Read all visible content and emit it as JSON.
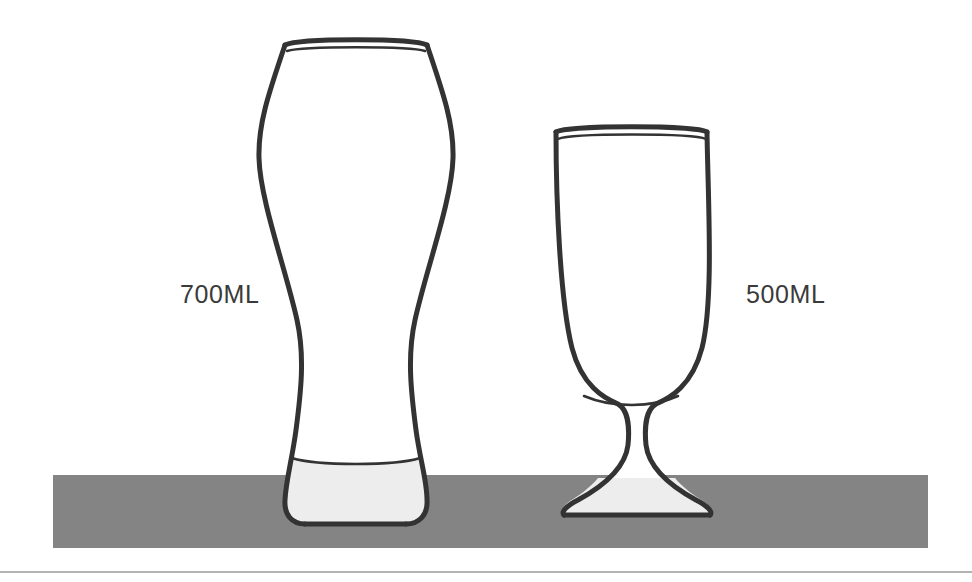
{
  "scene": {
    "title": "Beer glass size comparison",
    "background_color": "#ffffff",
    "stroke_color": "#333333",
    "table_band": {
      "name": "table surface band",
      "color": "#848484",
      "x": 53,
      "y": 475,
      "width": 875,
      "height": 73
    },
    "baseline_rule": {
      "name": "bottom horizontal rule",
      "color": "#9a9a9a",
      "y": 572
    }
  },
  "glasses": [
    {
      "id": "tall-weizen-glass",
      "label": "700ML",
      "label_x": 180,
      "label_y": 303,
      "type": "weizen",
      "liquid_fill_color": "#ededed",
      "rim_top_y": 40,
      "base_bottom_y": 524
    },
    {
      "id": "stemmed-goblet-glass",
      "label": "500ML",
      "label_x": 746,
      "label_y": 303,
      "type": "stemmed goblet",
      "liquid_fill_color": "#ededed",
      "rim_top_y": 128,
      "base_bottom_y": 515
    }
  ],
  "colors": {
    "outline": "#333333",
    "table": "#848484",
    "glass_fill": "#ffffff",
    "liquid_tint": "#ededed",
    "label_text": "#3a3a3a",
    "rule": "#9a9a9a"
  }
}
